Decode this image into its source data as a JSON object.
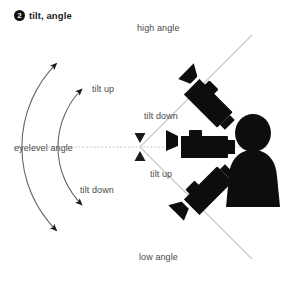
{
  "header": {
    "badge_number": "2",
    "title": "tilt, angle",
    "badge_icon": "numbered-circle-icon"
  },
  "colors": {
    "ink": "#111111",
    "label_text": "#4a4a4a",
    "ray_line": "#c9c9c9",
    "arc_line": "#6e6e6e",
    "dotted_line": "#b4b4b4",
    "background": "#ffffff"
  },
  "diagram": {
    "type": "camera-tilt-angle-diagram",
    "pivot": {
      "x": 140,
      "y": 147
    },
    "labels": {
      "high_angle": "high angle",
      "low_angle": "low angle",
      "eyelevel_angle": "eyelevel angle",
      "tilt_up_outer_top": "tilt up",
      "tilt_down_inner_top": "tilt down",
      "tilt_up_inner_bottom": "tilt up",
      "tilt_down_outer_bottom": "tilt down"
    },
    "cameras": [
      {
        "name": "camera-high-angle",
        "position": "upper",
        "aim": "downward",
        "rotation_deg": 45
      },
      {
        "name": "camera-eyelevel-angle",
        "position": "middle",
        "aim": "horizontal",
        "rotation_deg": 0
      },
      {
        "name": "camera-low-angle",
        "position": "lower",
        "aim": "upward",
        "rotation_deg": -45
      }
    ],
    "rays": [
      {
        "name": "ray-high-angle",
        "from_pivot_angle_deg": 135
      },
      {
        "name": "ray-eyelevel-angle",
        "from_pivot_angle_deg": 180
      },
      {
        "name": "ray-low-angle",
        "from_pivot_angle_deg": 225
      }
    ],
    "arcs": [
      {
        "name": "arc-outer",
        "radius": 118,
        "label_top": "tilt up",
        "label_bottom": "tilt down",
        "arrowheads": "both-ends"
      },
      {
        "name": "arc-inner",
        "radius": 82,
        "label_top": "tilt down",
        "label_bottom": "tilt up",
        "arrowheads": "both-ends"
      }
    ]
  }
}
